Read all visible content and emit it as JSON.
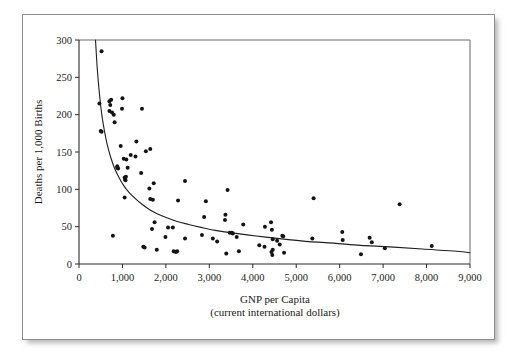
{
  "figure": {
    "frame_color": "#8e8e8e",
    "background": "#ffffff"
  },
  "chart_data": {
    "type": "scatter",
    "title": "",
    "xlabel": "GNP per Capita",
    "xlabel_sub": "(current international dollars)",
    "ylabel": "Deaths per 1,000 Births",
    "xlim": [
      0,
      9000
    ],
    "ylim": [
      0,
      300
    ],
    "xticks": [
      0,
      1000,
      2000,
      3000,
      4000,
      5000,
      6000,
      7000,
      8000,
      9000
    ],
    "xtick_labels": [
      "0",
      "1,000",
      "2,000",
      "3,000",
      "4,000",
      "5,000",
      "6,000",
      "7,000",
      "8,000",
      "9,000"
    ],
    "yticks": [
      0,
      50,
      100,
      150,
      200,
      250,
      300
    ],
    "ytick_labels": [
      "0",
      "50",
      "100",
      "150",
      "200",
      "250",
      "300"
    ],
    "grid": false,
    "legend": null,
    "point_color": "#141414",
    "curve_color": "#1f1f1f",
    "fit_curve": {
      "type": "power-decay",
      "description": "Smooth decreasing fitted curve from about (400, 300) falling steeply to about (2000, 70) and flattening to about (9000, 15)",
      "points": [
        [
          380,
          300
        ],
        [
          420,
          262
        ],
        [
          470,
          228
        ],
        [
          520,
          202
        ],
        [
          580,
          180
        ],
        [
          650,
          160
        ],
        [
          730,
          143
        ],
        [
          820,
          128
        ],
        [
          920,
          116
        ],
        [
          1030,
          105
        ],
        [
          1150,
          96
        ],
        [
          1290,
          88
        ],
        [
          1450,
          80
        ],
        [
          1620,
          73
        ],
        [
          1810,
          67
        ],
        [
          2020,
          62
        ],
        [
          2260,
          57
        ],
        [
          2520,
          53
        ],
        [
          2810,
          49
        ],
        [
          3130,
          45
        ],
        [
          3480,
          42
        ],
        [
          3870,
          39
        ],
        [
          4300,
          36
        ],
        [
          4770,
          33
        ],
        [
          5290,
          30
        ],
        [
          5860,
          28
        ],
        [
          6480,
          25
        ],
        [
          7160,
          23
        ],
        [
          7900,
          20
        ],
        [
          8700,
          17
        ],
        [
          9000,
          15
        ]
      ]
    },
    "points": [
      [
        520,
        285
      ],
      [
        470,
        215
      ],
      [
        500,
        178
      ],
      [
        520,
        177
      ],
      [
        700,
        218
      ],
      [
        720,
        213
      ],
      [
        740,
        220
      ],
      [
        700,
        205
      ],
      [
        760,
        203
      ],
      [
        800,
        200
      ],
      [
        820,
        190
      ],
      [
        1000,
        222
      ],
      [
        990,
        208
      ],
      [
        1450,
        208
      ],
      [
        960,
        158
      ],
      [
        1320,
        164
      ],
      [
        880,
        131
      ],
      [
        880,
        129
      ],
      [
        900,
        128
      ],
      [
        1030,
        141
      ],
      [
        1090,
        140
      ],
      [
        1120,
        129
      ],
      [
        1190,
        146
      ],
      [
        1300,
        144
      ],
      [
        1540,
        151
      ],
      [
        1640,
        154
      ],
      [
        1050,
        116
      ],
      [
        1060,
        114
      ],
      [
        1070,
        112
      ],
      [
        1080,
        117
      ],
      [
        1430,
        122
      ],
      [
        1620,
        101
      ],
      [
        1720,
        108
      ],
      [
        2440,
        111
      ],
      [
        1050,
        89
      ],
      [
        1640,
        87
      ],
      [
        1700,
        86
      ],
      [
        2280,
        85
      ],
      [
        2920,
        84
      ],
      [
        3420,
        99
      ],
      [
        1680,
        47
      ],
      [
        1740,
        56
      ],
      [
        2050,
        49
      ],
      [
        2160,
        49
      ],
      [
        2880,
        63
      ],
      [
        3370,
        66
      ],
      [
        3360,
        59
      ],
      [
        3630,
        36
      ],
      [
        3780,
        53
      ],
      [
        4280,
        50
      ],
      [
        4420,
        56
      ],
      [
        4440,
        46
      ],
      [
        5400,
        88
      ],
      [
        7380,
        80
      ],
      [
        780,
        38
      ],
      [
        1480,
        23
      ],
      [
        1510,
        22
      ],
      [
        1790,
        19
      ],
      [
        1990,
        36
      ],
      [
        2180,
        17
      ],
      [
        2230,
        16
      ],
      [
        2260,
        17
      ],
      [
        2440,
        34
      ],
      [
        2830,
        39
      ],
      [
        3080,
        34
      ],
      [
        3180,
        30
      ],
      [
        3470,
        42
      ],
      [
        3520,
        42
      ],
      [
        3540,
        41
      ],
      [
        3390,
        14
      ],
      [
        3680,
        17
      ],
      [
        4150,
        25
      ],
      [
        4270,
        23
      ],
      [
        4430,
        16
      ],
      [
        4450,
        12
      ],
      [
        4460,
        19
      ],
      [
        4460,
        33
      ],
      [
        4560,
        31
      ],
      [
        4620,
        26
      ],
      [
        4680,
        38
      ],
      [
        4700,
        37
      ],
      [
        4720,
        15
      ],
      [
        5370,
        34
      ],
      [
        6060,
        43
      ],
      [
        6070,
        32
      ],
      [
        6490,
        13
      ],
      [
        6690,
        35
      ],
      [
        6740,
        29
      ],
      [
        7040,
        21
      ],
      [
        8120,
        24
      ]
    ]
  }
}
